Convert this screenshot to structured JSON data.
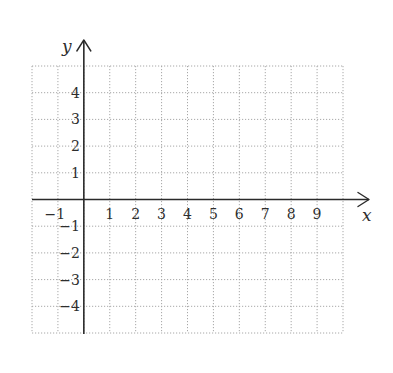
{
  "chart_data": {
    "type": "scatter",
    "title": "",
    "xlabel": "x",
    "ylabel": "y",
    "xlim": [
      -2,
      10
    ],
    "ylim": [
      -5,
      5
    ],
    "grid": true,
    "grid_style": "dotted",
    "x_ticks": [
      -1,
      1,
      2,
      3,
      4,
      5,
      6,
      7,
      8,
      9
    ],
    "y_ticks": [
      4,
      3,
      2,
      1,
      -1,
      -2,
      -3,
      -4
    ],
    "x_tick_labels": [
      "−1",
      "1",
      "2",
      "3",
      "4",
      "5",
      "6",
      "7",
      "8",
      "9"
    ],
    "y_tick_labels": [
      "4",
      "3",
      "2",
      "1",
      "−1",
      "−2",
      "−3",
      "−4"
    ],
    "series": [],
    "legend": null
  },
  "colors": {
    "grid": "#a8a8a8",
    "axis": "#2a2a2a",
    "text": "#2e2e2e",
    "background": "#ffffff"
  }
}
